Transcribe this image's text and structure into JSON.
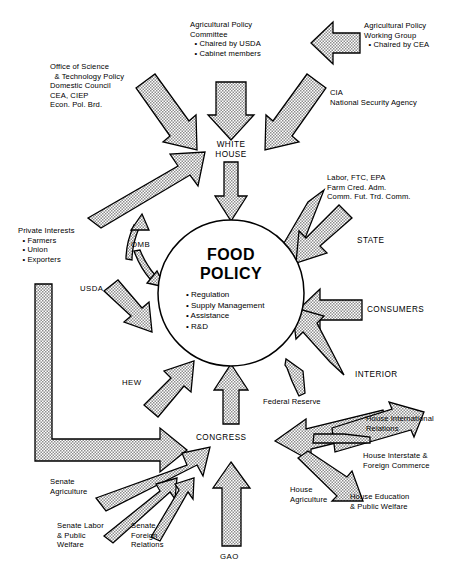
{
  "diagram": {
    "center": {
      "name": "FOOD\nPOLICY",
      "line1": "FOOD",
      "line2": "POLICY",
      "functions": "• Regulation\n• Supply Management\n• Assistance\n• R&D"
    },
    "hubs": [
      {
        "id": "white-house",
        "label": "WHITE\nHOUSE"
      },
      {
        "id": "congress",
        "label": "CONGRESS"
      }
    ],
    "nodes": [
      {
        "id": "agricultural-policy-committee",
        "label": "Agricultural Policy\nCommittee\n  • Chaired by USDA\n  • Cabinet members"
      },
      {
        "id": "agricultural-policy-working-group",
        "label": "Agricultural Policy\nWorking Group\n  • Chaired by CEA"
      },
      {
        "id": "office-of-science",
        "label": "Office of Science\n  & Technology Policy\nDomestic Council\nCEA, CIEP\nEcon. Pol. Brd."
      },
      {
        "id": "cia-nsa",
        "label": "CIA\nNational Security Agency"
      },
      {
        "id": "labor-ftc-epa",
        "label": "Labor, FTC, EPA\nFarm Cred. Adm.\nComm. Fut. Trd. Comm."
      },
      {
        "id": "state",
        "label": "STATE"
      },
      {
        "id": "consumers",
        "label": "CONSUMERS"
      },
      {
        "id": "interior",
        "label": "INTERIOR"
      },
      {
        "id": "federal-reserve",
        "label": "Federal Reserve"
      },
      {
        "id": "private-interests",
        "label": "Private Interests\n  • Farmers\n  • Union\n  • Exporters"
      },
      {
        "id": "omb",
        "label": "OMB"
      },
      {
        "id": "usda",
        "label": "USDA"
      },
      {
        "id": "hew",
        "label": "HEW"
      },
      {
        "id": "gao",
        "label": "GAO"
      },
      {
        "id": "senate-agriculture",
        "label": "Senate\nAgriculture"
      },
      {
        "id": "senate-labor-public-welfare",
        "label": "Senate Labor\n& Public\nWelfare"
      },
      {
        "id": "senate-foreign-relations",
        "label": "Senate\nForeign\nRelations"
      },
      {
        "id": "house-international-relations",
        "label": "House International\nRelations"
      },
      {
        "id": "house-interstate-foreign-commerce",
        "label": "House Interstate &\nForeign Commerce"
      },
      {
        "id": "house-agriculture",
        "label": "House\nAgriculture"
      },
      {
        "id": "house-education-public-welfare",
        "label": "House Education\n& Public Welfare"
      }
    ],
    "colors": {
      "outline": "#000000",
      "arrow_fill": "#c9c9c9",
      "background": "#ffffff",
      "text": "#000000"
    }
  }
}
